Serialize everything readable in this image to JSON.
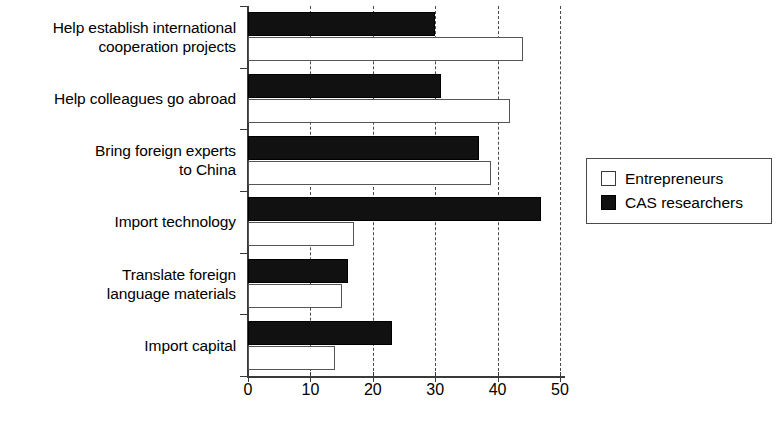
{
  "chart_data": {
    "type": "bar",
    "orientation": "horizontal",
    "title": "",
    "subtitle": "",
    "xlabel": "",
    "ylabel": "",
    "xlim": [
      0,
      50
    ],
    "xticks": [
      0,
      10,
      20,
      30,
      40,
      50
    ],
    "xtick_labels": [
      "0",
      "10",
      "20",
      "30",
      "40",
      "50"
    ],
    "grid": "vertical-dashed",
    "legend_position": "right",
    "categories": [
      "Help establish international\ncooperation projects",
      "Help colleagues go abroad",
      "Bring foreign experts\nto China",
      "Import technology",
      "Translate foreign\nlanguage materials",
      "Import capital"
    ],
    "series": [
      {
        "name": "CAS researchers",
        "color": "#111111",
        "fill": "solid-black",
        "values": [
          30,
          31,
          37,
          47,
          16,
          23
        ]
      },
      {
        "name": "Entrepreneurs",
        "color": "#ffffff",
        "fill": "white-outline",
        "values": [
          44,
          42,
          39,
          17,
          15,
          14
        ]
      }
    ],
    "legend_entries": [
      "Entrepreneurs",
      "CAS researchers"
    ]
  },
  "legend": {
    "items": [
      {
        "label": "Entrepreneurs"
      },
      {
        "label": "CAS researchers"
      }
    ]
  }
}
